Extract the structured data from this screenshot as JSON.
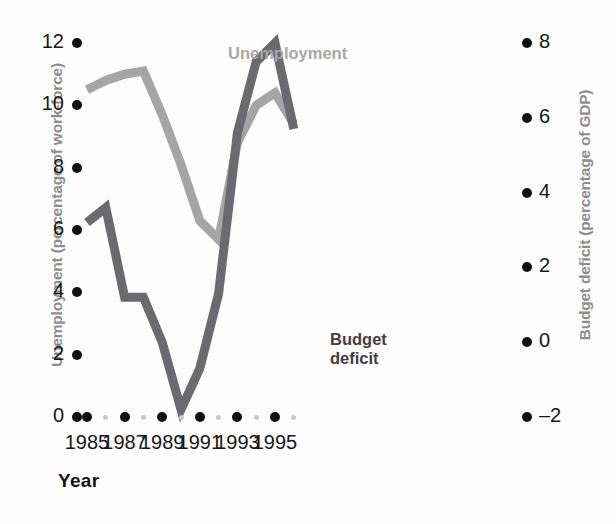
{
  "chart_data": {
    "type": "line",
    "title": "",
    "xlabel": "Year",
    "x_tick_labels": [
      "1985",
      "1987",
      "1989",
      "1991",
      "1993",
      "1995"
    ],
    "x_ticks_major": [
      1985,
      1987,
      1989,
      1991,
      1993,
      1995
    ],
    "x_ticks_minor": [
      1986,
      1988,
      1990,
      1992,
      1994,
      1996
    ],
    "xlim": [
      1985,
      1996
    ],
    "grid": false,
    "legend_position": "inline-annotations",
    "axes": [
      {
        "id": "left",
        "label": "Unemployment (percentage of work-force)",
        "ticks": [
          0,
          2,
          4,
          6,
          8,
          10,
          12
        ],
        "tick_labels": [
          "0",
          "2",
          "4",
          "6",
          "8",
          "10",
          "12"
        ],
        "ylim": [
          0,
          12
        ]
      },
      {
        "id": "right",
        "label": "Budget deficit (percentage of GDP)",
        "ticks": [
          -2,
          0,
          2,
          4,
          6,
          8
        ],
        "tick_labels": [
          "-2",
          "0",
          "2",
          "4",
          "6",
          "8"
        ],
        "ylim": [
          -2,
          8
        ]
      }
    ],
    "series": [
      {
        "name": "Unemployment",
        "axis": "left",
        "color": "#a5a5a5",
        "unit": "percentage of work-force",
        "x": [
          1985,
          1986,
          1987,
          1988,
          1989,
          1990,
          1991,
          1992,
          1993,
          1994,
          1995,
          1996
        ],
        "values": [
          10.5,
          10.8,
          11.0,
          11.1,
          9.7,
          8.1,
          6.3,
          5.7,
          8.8,
          10.0,
          10.4,
          9.4
        ]
      },
      {
        "name": "Budget deficit",
        "axis": "right",
        "color": "#6a6a6f",
        "unit": "percentage of GDP",
        "x": [
          1985,
          1986,
          1987,
          1988,
          1989,
          1990,
          1991,
          1992,
          1993,
          1994,
          1995,
          1996
        ],
        "values": [
          3.2,
          3.6,
          1.2,
          1.2,
          0.0,
          -1.8,
          -0.7,
          1.3,
          5.6,
          7.5,
          8.0,
          5.7
        ]
      }
    ],
    "annotations": [
      {
        "text": "Unemployment",
        "series": "Unemployment"
      },
      {
        "text": "Budget\ndeficit",
        "series": "Budget deficit"
      }
    ]
  },
  "labels": {
    "y_left_title": "Unemployment (percentage of work-force)",
    "y_right_title": "Budget deficit (percentage of GDP)",
    "x_title": "Year",
    "series_unemployment": "Unemployment",
    "series_deficit": "Budget\ndeficit"
  },
  "colors": {
    "unemployment_line": "#a5a5a5",
    "deficit_line": "#6a6a6f",
    "tick_dot": "#111114",
    "minor_dot": "#c9c9cb",
    "axis_title": "#8d8d8d",
    "background": "#fdfdfd"
  }
}
